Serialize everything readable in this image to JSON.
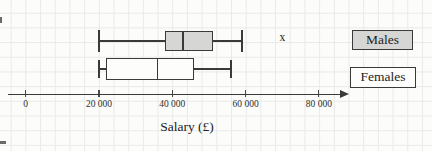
{
  "chart_data": {
    "type": "boxplot",
    "orientation": "horizontal",
    "title": "",
    "xlabel": "Salary (£)",
    "ylabel": "",
    "grid": true,
    "legend_position": "right",
    "outlier_marker": "x",
    "x_axis": {
      "min": 0,
      "max": 88000,
      "ticks": [
        {
          "value": 0,
          "label": "0"
        },
        {
          "value": 20000,
          "label": "20 000"
        },
        {
          "value": 40000,
          "label": "40 000"
        },
        {
          "value": 60000,
          "label": "60 000"
        },
        {
          "value": 80000,
          "label": "80 000"
        }
      ]
    },
    "series": [
      {
        "name": "Males",
        "min": 20000,
        "q1": 38000,
        "median": 43000,
        "q3": 51000,
        "max": 59000,
        "outliers": [
          70000
        ],
        "fill": "#d6d6d4"
      },
      {
        "name": "Females",
        "min": 20000,
        "q1": 22000,
        "median": 36000,
        "q3": 46000,
        "max": 56000,
        "outliers": [],
        "fill": "#fdfdfc"
      }
    ]
  },
  "colors": {
    "line": "#3a3a3a",
    "grid": "#e8ebe8",
    "background": "#fcfcfa",
    "text": "#2e2e2e"
  }
}
